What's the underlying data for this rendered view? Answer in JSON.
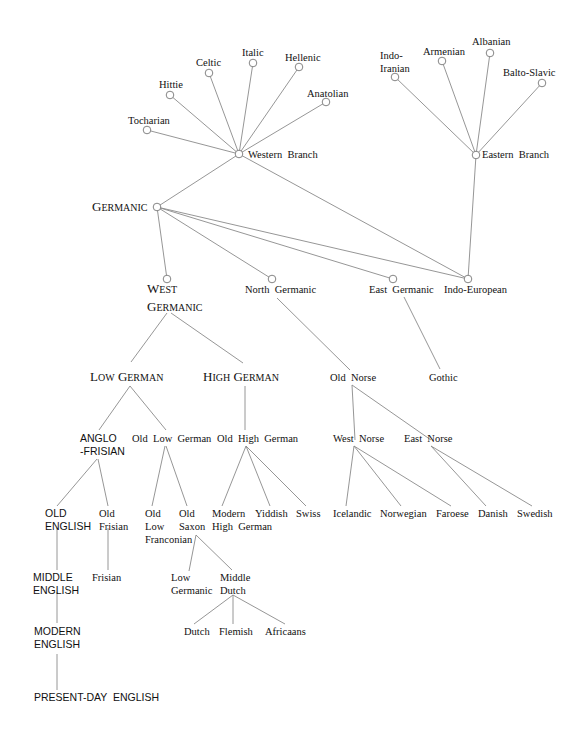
{
  "colors": {
    "edge": "#8a8a8a",
    "node": "#777777",
    "text": "#111111",
    "background": "#ffffff"
  },
  "nodes": [
    {
      "id": "tocharian",
      "label": [
        "Tocharian"
      ],
      "x": 147,
      "y": 130,
      "circle": true,
      "lx": 128,
      "ly": 124,
      "anchor": "start",
      "style": "lbl"
    },
    {
      "id": "hittie",
      "label": [
        "Hittie"
      ],
      "x": 170,
      "y": 95,
      "circle": true,
      "lx": 159,
      "ly": 88,
      "anchor": "start",
      "style": "lbl"
    },
    {
      "id": "celtic",
      "label": [
        "Celtic"
      ],
      "x": 209,
      "y": 73,
      "circle": true,
      "lx": 196,
      "ly": 66,
      "anchor": "start",
      "style": "lbl"
    },
    {
      "id": "italic",
      "label": [
        "Italic"
      ],
      "x": 253,
      "y": 63,
      "circle": true,
      "lx": 242,
      "ly": 56,
      "anchor": "start",
      "style": "lbl"
    },
    {
      "id": "hellenic",
      "label": [
        "Hellenic"
      ],
      "x": 299,
      "y": 67,
      "circle": true,
      "lx": 285,
      "ly": 61,
      "anchor": "start",
      "style": "lbl"
    },
    {
      "id": "anatolian",
      "label": [
        "Anatolian"
      ],
      "x": 326,
      "y": 102,
      "circle": true,
      "lx": 307,
      "ly": 97,
      "anchor": "start",
      "style": "lbl"
    },
    {
      "id": "western-branch",
      "label": [
        "Western  Branch"
      ],
      "x": 239,
      "y": 154,
      "circle": true,
      "lx": 248,
      "ly": 158,
      "anchor": "start",
      "style": "lbl"
    },
    {
      "id": "indo-iranian",
      "label": [
        "Indo-",
        "Iranian"
      ],
      "x": 395,
      "y": 77,
      "circle": true,
      "lx": 380,
      "ly": 59,
      "anchor": "start",
      "style": "lbl"
    },
    {
      "id": "armenian",
      "label": [
        "Armenian"
      ],
      "x": 442,
      "y": 61,
      "circle": true,
      "lx": 423,
      "ly": 55,
      "anchor": "start",
      "style": "lbl"
    },
    {
      "id": "albanian",
      "label": [
        "Albanian"
      ],
      "x": 490,
      "y": 53,
      "circle": true,
      "lx": 472,
      "ly": 45,
      "anchor": "start",
      "style": "lbl"
    },
    {
      "id": "balto-slavic",
      "label": [
        "Balto-Slavic"
      ],
      "x": 542,
      "y": 83,
      "circle": true,
      "lx": 503,
      "ly": 76,
      "anchor": "start",
      "style": "lbl"
    },
    {
      "id": "eastern-branch",
      "label": [
        "Eastern  Branch"
      ],
      "x": 476,
      "y": 155,
      "circle": true,
      "lx": 482,
      "ly": 158,
      "anchor": "start",
      "style": "lbl"
    },
    {
      "id": "germanic",
      "label": [
        "Germanic"
      ],
      "x": 157,
      "y": 207,
      "circle": true,
      "lx": 92,
      "ly": 211,
      "anchor": "start",
      "style": "smallcaps"
    },
    {
      "id": "west-germanic",
      "label": [
        "West",
        "Germanic"
      ],
      "x": 167,
      "y": 279,
      "circle": true,
      "lx": 147,
      "ly": 293,
      "anchor": "start",
      "style": "smallcaps"
    },
    {
      "id": "north-germanic",
      "label": [
        "North  Germanic"
      ],
      "x": 272,
      "y": 279,
      "circle": true,
      "lx": 245,
      "ly": 293,
      "anchor": "start",
      "style": "lbl"
    },
    {
      "id": "east-germanic",
      "label": [
        "East  Germanic"
      ],
      "x": 393,
      "y": 279,
      "circle": true,
      "lx": 369,
      "ly": 293,
      "anchor": "start",
      "style": "lbl"
    },
    {
      "id": "indo-european",
      "label": [
        "Indo-European"
      ],
      "x": 468,
      "y": 279,
      "circle": true,
      "lx": 444,
      "ly": 293,
      "anchor": "start",
      "style": "lbl"
    },
    {
      "id": "low-german",
      "label": [
        "Low German"
      ],
      "x": 130,
      "y": 363,
      "circle": false,
      "lx": 90,
      "ly": 381,
      "anchor": "start",
      "style": "smallcaps"
    },
    {
      "id": "high-german",
      "label": [
        "High German"
      ],
      "x": 245,
      "y": 363,
      "circle": false,
      "lx": 203,
      "ly": 381,
      "anchor": "start",
      "style": "smallcaps"
    },
    {
      "id": "old-norse",
      "label": [
        "Old  Norse"
      ],
      "x": 352,
      "y": 371,
      "circle": false,
      "lx": 330,
      "ly": 381,
      "anchor": "start",
      "style": "lbl"
    },
    {
      "id": "gothic",
      "label": [
        "Gothic"
      ],
      "x": 440,
      "y": 369,
      "circle": false,
      "lx": 429,
      "ly": 381,
      "anchor": "start",
      "style": "lbl"
    },
    {
      "id": "anglo-frisian",
      "label": [
        "ANGLO",
        "-FRISIAN"
      ],
      "x": 99,
      "y": 430,
      "circle": false,
      "lx": 80,
      "ly": 442,
      "anchor": "start",
      "style": "sans"
    },
    {
      "id": "old-low-german",
      "label": [
        "Old  Low  German"
      ],
      "x": 166,
      "y": 430,
      "circle": false,
      "lx": 132,
      "ly": 442,
      "anchor": "start",
      "style": "lbl"
    },
    {
      "id": "old-high-german",
      "label": [
        "Old  High  German"
      ],
      "x": 245,
      "y": 430,
      "circle": false,
      "lx": 217,
      "ly": 442,
      "anchor": "start",
      "style": "lbl"
    },
    {
      "id": "west-norse",
      "label": [
        "West  Norse"
      ],
      "x": 355,
      "y": 440,
      "circle": false,
      "lx": 333,
      "ly": 442,
      "anchor": "start",
      "style": "lbl"
    },
    {
      "id": "east-norse",
      "label": [
        "East  Norse"
      ],
      "x": 431,
      "y": 440,
      "circle": false,
      "lx": 404,
      "ly": 442,
      "anchor": "start",
      "style": "lbl"
    },
    {
      "id": "old-english",
      "label": [
        "OLD",
        "ENGLISH"
      ],
      "x": 57,
      "y": 506,
      "circle": false,
      "lx": 45,
      "ly": 517,
      "anchor": "start",
      "style": "sans"
    },
    {
      "id": "old-frisian",
      "label": [
        "Old",
        "Frisian"
      ],
      "x": 108,
      "y": 506,
      "circle": false,
      "lx": 99,
      "ly": 517,
      "anchor": "start",
      "style": "lbl"
    },
    {
      "id": "old-low-franconian",
      "label": [
        "Old",
        "Low",
        "Franconian"
      ],
      "x": 152,
      "y": 506,
      "circle": false,
      "lx": 145,
      "ly": 517,
      "anchor": "start",
      "style": "lbl"
    },
    {
      "id": "old-saxon",
      "label": [
        "Old",
        "Saxon"
      ],
      "x": 187,
      "y": 506,
      "circle": false,
      "lx": 179,
      "ly": 517,
      "anchor": "start",
      "style": "lbl"
    },
    {
      "id": "modern-high-german",
      "label": [
        "Modern",
        "High  German"
      ],
      "x": 222,
      "y": 506,
      "circle": false,
      "lx": 212,
      "ly": 517,
      "anchor": "start",
      "style": "lbl"
    },
    {
      "id": "yiddish",
      "label": [
        "Yiddish"
      ],
      "x": 270,
      "y": 506,
      "circle": false,
      "lx": 255,
      "ly": 517,
      "anchor": "start",
      "style": "lbl"
    },
    {
      "id": "swiss",
      "label": [
        "Swiss"
      ],
      "x": 306,
      "y": 506,
      "circle": false,
      "lx": 296,
      "ly": 517,
      "anchor": "start",
      "style": "lbl"
    },
    {
      "id": "icelandic",
      "label": [
        "Icelandic"
      ],
      "x": 346,
      "y": 506,
      "circle": false,
      "lx": 333,
      "ly": 517,
      "anchor": "start",
      "style": "lbl"
    },
    {
      "id": "norwegian",
      "label": [
        "Norwegian"
      ],
      "x": 401,
      "y": 506,
      "circle": false,
      "lx": 380,
      "ly": 517,
      "anchor": "start",
      "style": "lbl"
    },
    {
      "id": "faroese",
      "label": [
        "Faroese"
      ],
      "x": 451,
      "y": 506,
      "circle": false,
      "lx": 436,
      "ly": 517,
      "anchor": "start",
      "style": "lbl"
    },
    {
      "id": "danish",
      "label": [
        "Danish"
      ],
      "x": 486,
      "y": 506,
      "circle": false,
      "lx": 478,
      "ly": 517,
      "anchor": "start",
      "style": "lbl"
    },
    {
      "id": "swedish",
      "label": [
        "Swedish"
      ],
      "x": 532,
      "y": 506,
      "circle": false,
      "lx": 517,
      "ly": 517,
      "anchor": "start",
      "style": "lbl"
    },
    {
      "id": "middle-english",
      "label": [
        "MIDDLE",
        "ENGLISH"
      ],
      "x": 57,
      "y": 570,
      "circle": false,
      "lx": 33,
      "ly": 581,
      "anchor": "start",
      "style": "sans"
    },
    {
      "id": "frisian",
      "label": [
        "Frisian"
      ],
      "x": 108,
      "y": 570,
      "circle": false,
      "lx": 92,
      "ly": 581,
      "anchor": "start",
      "style": "lbl"
    },
    {
      "id": "low-germanic",
      "label": [
        "Low",
        "Germanic"
      ],
      "x": 189,
      "y": 570,
      "circle": false,
      "lx": 171,
      "ly": 581,
      "anchor": "start",
      "style": "lbl"
    },
    {
      "id": "middle-dutch",
      "label": [
        "Middle",
        "Dutch"
      ],
      "x": 232,
      "y": 570,
      "circle": false,
      "lx": 220,
      "ly": 581,
      "anchor": "start",
      "style": "lbl"
    },
    {
      "id": "dutch",
      "label": [
        "Dutch"
      ],
      "x": 194,
      "y": 628,
      "circle": false,
      "lx": 184,
      "ly": 635,
      "anchor": "start",
      "style": "lbl"
    },
    {
      "id": "flemish",
      "label": [
        "Flemish"
      ],
      "x": 233,
      "y": 628,
      "circle": false,
      "lx": 219,
      "ly": 635,
      "anchor": "start",
      "style": "lbl"
    },
    {
      "id": "africaans",
      "label": [
        "Africaans"
      ],
      "x": 285,
      "y": 628,
      "circle": false,
      "lx": 265,
      "ly": 635,
      "anchor": "start",
      "style": "lbl"
    },
    {
      "id": "modern-english",
      "label": [
        "MODERN",
        "ENGLISH"
      ],
      "x": 57,
      "y": 640,
      "circle": false,
      "lx": 34,
      "ly": 635,
      "anchor": "start",
      "style": "sans"
    },
    {
      "id": "present-day-english",
      "label": [
        "PRESENT-DAY  ENGLISH"
      ],
      "x": 57,
      "y": 698,
      "circle": false,
      "lx": 34,
      "ly": 701,
      "anchor": "start",
      "style": "sans"
    }
  ],
  "edges": [
    {
      "from": [
        147,
        130
      ],
      "to": [
        239,
        154
      ]
    },
    {
      "from": [
        170,
        95
      ],
      "to": [
        239,
        154
      ]
    },
    {
      "from": [
        209,
        73
      ],
      "to": [
        239,
        154
      ]
    },
    {
      "from": [
        253,
        63
      ],
      "to": [
        239,
        154
      ]
    },
    {
      "from": [
        299,
        67
      ],
      "to": [
        239,
        154
      ]
    },
    {
      "from": [
        326,
        102
      ],
      "to": [
        239,
        154
      ]
    },
    {
      "from": [
        395,
        77
      ],
      "to": [
        476,
        155
      ]
    },
    {
      "from": [
        442,
        61
      ],
      "to": [
        476,
        155
      ]
    },
    {
      "from": [
        490,
        53
      ],
      "to": [
        476,
        155
      ]
    },
    {
      "from": [
        542,
        83
      ],
      "to": [
        476,
        155
      ]
    },
    {
      "from": [
        239,
        154
      ],
      "to": [
        157,
        207
      ]
    },
    {
      "from": [
        239,
        154
      ],
      "to": [
        468,
        279
      ]
    },
    {
      "from": [
        476,
        155
      ],
      "to": [
        468,
        279
      ]
    },
    {
      "from": [
        157,
        207
      ],
      "to": [
        167,
        279
      ]
    },
    {
      "from": [
        157,
        207
      ],
      "to": [
        272,
        279
      ]
    },
    {
      "from": [
        157,
        207
      ],
      "to": [
        393,
        279
      ]
    },
    {
      "from": [
        157,
        207
      ],
      "to": [
        468,
        279
      ]
    },
    {
      "from": [
        167,
        313
      ],
      "to": [
        131,
        362
      ]
    },
    {
      "from": [
        171,
        313
      ],
      "to": [
        243,
        363
      ]
    },
    {
      "from": [
        277,
        298
      ],
      "to": [
        350,
        370
      ]
    },
    {
      "from": [
        404,
        297
      ],
      "to": [
        440,
        369
      ]
    },
    {
      "from": [
        130,
        386
      ],
      "to": [
        99,
        430
      ]
    },
    {
      "from": [
        130,
        386
      ],
      "to": [
        166,
        430
      ]
    },
    {
      "from": [
        245,
        386
      ],
      "to": [
        245,
        430
      ]
    },
    {
      "from": [
        352,
        385
      ],
      "to": [
        355,
        440
      ]
    },
    {
      "from": [
        352,
        385
      ],
      "to": [
        431,
        440
      ]
    },
    {
      "from": [
        97,
        459
      ],
      "to": [
        57,
        506
      ]
    },
    {
      "from": [
        98,
        459
      ],
      "to": [
        108,
        506
      ]
    },
    {
      "from": [
        165,
        446
      ],
      "to": [
        152,
        506
      ]
    },
    {
      "from": [
        166,
        446
      ],
      "to": [
        187,
        506
      ]
    },
    {
      "from": [
        246,
        446
      ],
      "to": [
        222,
        506
      ]
    },
    {
      "from": [
        246,
        446
      ],
      "to": [
        270,
        506
      ]
    },
    {
      "from": [
        246,
        446
      ],
      "to": [
        306,
        506
      ]
    },
    {
      "from": [
        354,
        446
      ],
      "to": [
        346,
        506
      ]
    },
    {
      "from": [
        354,
        446
      ],
      "to": [
        401,
        506
      ]
    },
    {
      "from": [
        354,
        446
      ],
      "to": [
        451,
        506
      ]
    },
    {
      "from": [
        431,
        446
      ],
      "to": [
        486,
        506
      ]
    },
    {
      "from": [
        431,
        446
      ],
      "to": [
        532,
        506
      ]
    },
    {
      "from": [
        57,
        528
      ],
      "to": [
        57,
        570
      ]
    },
    {
      "from": [
        108,
        528
      ],
      "to": [
        108,
        570
      ]
    },
    {
      "from": [
        196,
        535
      ],
      "to": [
        189,
        571
      ]
    },
    {
      "from": [
        196,
        535
      ],
      "to": [
        232,
        570
      ]
    },
    {
      "from": [
        57,
        592
      ],
      "to": [
        57,
        623
      ]
    },
    {
      "from": [
        233,
        595
      ],
      "to": [
        194,
        624
      ]
    },
    {
      "from": [
        233,
        595
      ],
      "to": [
        233,
        624
      ]
    },
    {
      "from": [
        233,
        595
      ],
      "to": [
        285,
        624
      ]
    },
    {
      "from": [
        57,
        654
      ],
      "to": [
        57,
        690
      ]
    }
  ]
}
